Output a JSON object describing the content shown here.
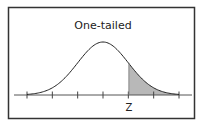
{
  "diagram": {
    "title": "One-tailed",
    "marker_label": "Z",
    "curve": "normal-distribution",
    "shaded_region": "right-tail",
    "tick_count": 7,
    "colors": {
      "border": "#333333",
      "curve": "#222222",
      "axis": "#555555",
      "shade": "#b8b8b8",
      "background": "#ffffff"
    }
  },
  "chart_data": {
    "type": "area",
    "title": "One-tailed",
    "xlabel": "",
    "ylabel": "",
    "x": [
      -3,
      -2,
      -1,
      0,
      1,
      2,
      3
    ],
    "curve": "standard normal density",
    "tick_labels": [
      "",
      "",
      "",
      "",
      "Z",
      "",
      ""
    ],
    "shaded": {
      "from": 1,
      "to": 3,
      "label": "Z"
    },
    "grid": false,
    "legend": null
  }
}
